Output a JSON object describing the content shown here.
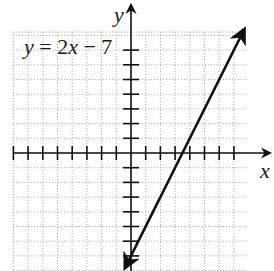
{
  "chart_data": {
    "type": "line",
    "equation": {
      "prefix": "y",
      "eq": " = 2",
      "var": "x",
      "suffix": " − 7"
    },
    "xlabel": "x",
    "ylabel": "y",
    "xlim": [
      -8,
      8
    ],
    "ylim": [
      -8,
      8
    ],
    "grid": true,
    "grid_style": "dotted",
    "x_ticks": [
      -8,
      -7,
      -6,
      -5,
      -4,
      -3,
      -2,
      -1,
      1,
      2,
      3,
      4,
      5,
      6,
      7
    ],
    "y_ticks": [
      -7,
      -6,
      -5,
      -4,
      -3,
      -2,
      -1,
      1,
      2,
      3,
      4,
      5,
      6,
      7
    ],
    "series": [
      {
        "name": "y = 2x - 7",
        "slope": 2,
        "intercept": -7,
        "x": [
          -0.4,
          7.7
        ],
        "y": [
          -7.8,
          8.4
        ],
        "arrows": "both"
      }
    ],
    "key_points": {
      "y_intercept": [
        0,
        -7
      ],
      "x_intercept": [
        3.5,
        0
      ]
    }
  },
  "colors": {
    "axis": "#111111",
    "grid": "#9a9a9a",
    "line": "#111111"
  }
}
